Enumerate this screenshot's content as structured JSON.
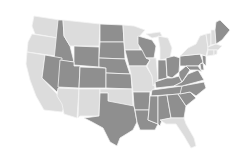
{
  "map": {
    "title": "",
    "region": "Contiguous United States",
    "colors": {
      "highlighted": "#8f8f8f",
      "other": "#dcdcdc",
      "border": "#f4f4f4",
      "background": "#ffffff"
    },
    "states": [
      {
        "id": "WA",
        "group": "light"
      },
      {
        "id": "OR",
        "group": "light"
      },
      {
        "id": "CA",
        "group": "light"
      },
      {
        "id": "ID",
        "group": "dark"
      },
      {
        "id": "NV",
        "group": "dark"
      },
      {
        "id": "MT",
        "group": "light"
      },
      {
        "id": "WY",
        "group": "dark"
      },
      {
        "id": "UT",
        "group": "dark"
      },
      {
        "id": "CO",
        "group": "dark"
      },
      {
        "id": "AZ",
        "group": "light"
      },
      {
        "id": "NM",
        "group": "light"
      },
      {
        "id": "ND",
        "group": "dark"
      },
      {
        "id": "SD",
        "group": "dark"
      },
      {
        "id": "NE",
        "group": "dark"
      },
      {
        "id": "KS",
        "group": "dark"
      },
      {
        "id": "OK",
        "group": "light"
      },
      {
        "id": "TX",
        "group": "dark"
      },
      {
        "id": "MN",
        "group": "light"
      },
      {
        "id": "IA",
        "group": "dark"
      },
      {
        "id": "MO",
        "group": "light"
      },
      {
        "id": "AR",
        "group": "dark"
      },
      {
        "id": "LA",
        "group": "dark"
      },
      {
        "id": "WI",
        "group": "dark"
      },
      {
        "id": "IL",
        "group": "light"
      },
      {
        "id": "MI",
        "group": "light"
      },
      {
        "id": "IN",
        "group": "dark"
      },
      {
        "id": "OH",
        "group": "dark"
      },
      {
        "id": "KY",
        "group": "dark"
      },
      {
        "id": "TN",
        "group": "dark"
      },
      {
        "id": "MS",
        "group": "dark"
      },
      {
        "id": "AL",
        "group": "dark"
      },
      {
        "id": "GA",
        "group": "dark"
      },
      {
        "id": "FL",
        "group": "light"
      },
      {
        "id": "SC",
        "group": "dark"
      },
      {
        "id": "NC",
        "group": "dark"
      },
      {
        "id": "VA",
        "group": "dark"
      },
      {
        "id": "WV",
        "group": "dark"
      },
      {
        "id": "PA",
        "group": "dark"
      },
      {
        "id": "NY",
        "group": "light"
      },
      {
        "id": "NJ",
        "group": "dark"
      },
      {
        "id": "MD",
        "group": "dark"
      },
      {
        "id": "DE",
        "group": "dark"
      },
      {
        "id": "VT",
        "group": "light"
      },
      {
        "id": "NH",
        "group": "light"
      },
      {
        "id": "ME",
        "group": "dark"
      },
      {
        "id": "MA",
        "group": "light"
      },
      {
        "id": "CT",
        "group": "light"
      },
      {
        "id": "RI",
        "group": "light"
      }
    ]
  }
}
